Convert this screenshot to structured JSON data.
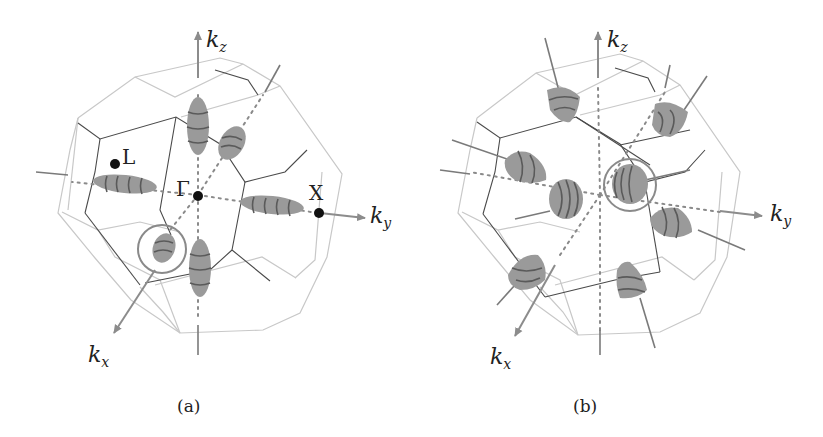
{
  "figure": {
    "panels": [
      {
        "id": "a",
        "caption": "(a)",
        "axes": {
          "kz": "k",
          "kz_sub": "z",
          "ky": "k",
          "ky_sub": "y",
          "kx": "k",
          "kx_sub": "x"
        },
        "points": {
          "gamma": "Γ",
          "L": "L",
          "X": "X"
        },
        "pocket_shape": "ellipsoid",
        "pocket_count": 6
      },
      {
        "id": "b",
        "caption": "(b)",
        "axes": {
          "kz": "k",
          "kz_sub": "z",
          "ky": "k",
          "ky_sub": "y",
          "kx": "k",
          "kx_sub": "x"
        },
        "pocket_shape": "cone",
        "pocket_count": 8
      }
    ],
    "colors": {
      "pocket": "#9a9a9a",
      "edge_front": "#4a4a4a",
      "edge_back": "#c8c8c8",
      "axis": "#8c8c8c"
    }
  }
}
